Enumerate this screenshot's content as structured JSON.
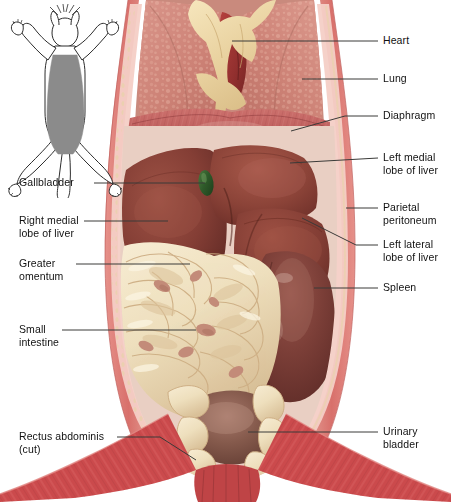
{
  "figure": {
    "inset": {
      "name": "orientation-inset",
      "description": "Supine cat silhouette with shaded ventral dissection field",
      "shade_color": "#8b8b8b",
      "outline_color": "#2b2b2b"
    }
  },
  "labels": {
    "heart": "Heart",
    "lung": "Lung",
    "diaphragm": "Diaphragm",
    "left_medial_lobe": "Left medial\nlobe of liver",
    "parietal_peritoneum": "Parietal\nperitoneum",
    "left_lateral_lobe": "Left lateral\nlobe of liver",
    "spleen": "Spleen",
    "urinary_bladder": "Urinary\nbladder",
    "gallbladder": "Gallbladder",
    "right_medial_lobe": "Right medial\nlobe of liver",
    "greater_omentum": "Greater\nomentum",
    "small_intestine": "Small\nintestine",
    "rectus_abdominis": "Rectus abdominis\n(cut)"
  },
  "colors": {
    "background": "#ffffff",
    "heart": "#a33a38",
    "lung": "#d38b7e",
    "lung_mottle": "#e8b5a6",
    "thymus_fat": "#ecd7a8",
    "diaphragm": "#c0615f",
    "liver": "#8a4138",
    "liver_highlight": "#a4584b",
    "gallbladder": "#2f5b2a",
    "spleen": "#7e3f38",
    "omentum": "#f0e0c0",
    "omentum_shadow": "#d6bd95",
    "intestine_pink": "#c08878",
    "bladder": "#7a4a3e",
    "body_wall": "#d9746e",
    "peritoneum": "#f0c8bf",
    "muscle_red": "#cf4a4a",
    "muscle_red_dark": "#a83a3c",
    "leader_line": "#3a3a38",
    "text": "#111111"
  }
}
